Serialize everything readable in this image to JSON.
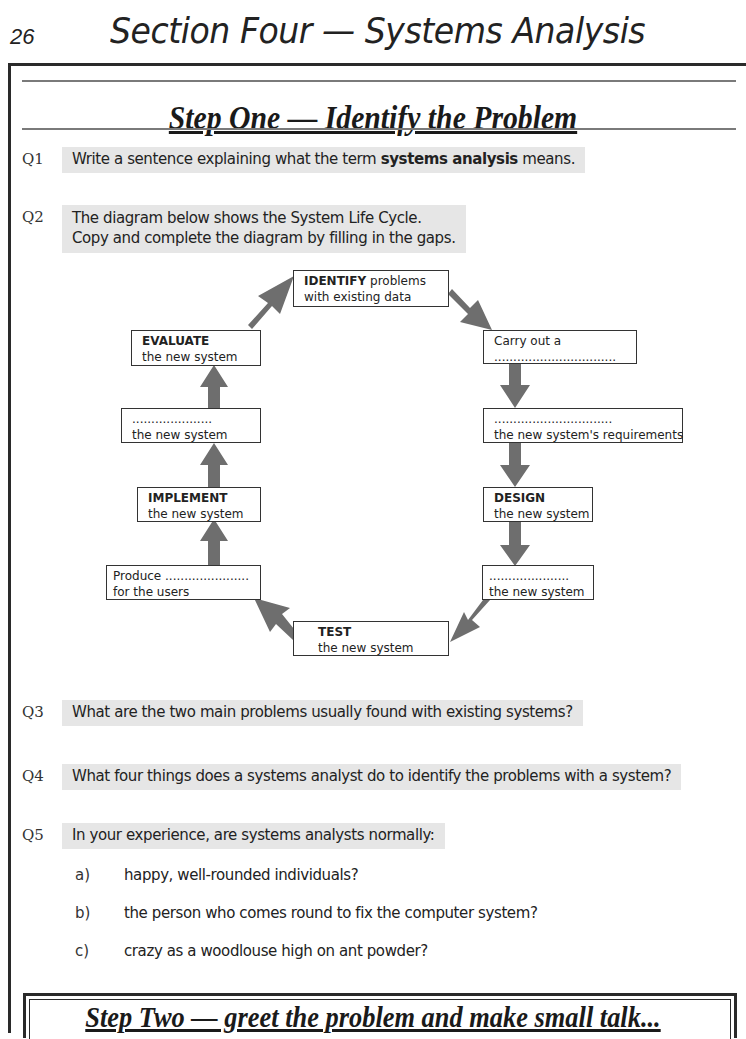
{
  "header": {
    "page_number": "26",
    "section_title": "Section Four — Systems Analysis"
  },
  "step_one": {
    "title": "Step One — Identify the Problem"
  },
  "questions": {
    "q1": {
      "number": "Q1",
      "text_before": "Write a sentence explaining what the term ",
      "text_bold": "systems analysis",
      "text_after": " means."
    },
    "q2": {
      "number": "Q2",
      "line1": "The diagram below shows the System Life Cycle.",
      "line2": "Copy and complete the diagram by filling in the gaps."
    },
    "q3": {
      "number": "Q3",
      "text": "What are the two main problems usually found with existing systems?"
    },
    "q4": {
      "number": "Q4",
      "text": "What four things does a systems analyst do to identify the problems with a system?"
    },
    "q5": {
      "number": "Q5",
      "text": "In your experience, are systems analysts normally:",
      "options": [
        {
          "label": "a)",
          "text": "happy, well-rounded individuals?"
        },
        {
          "label": "b)",
          "text": "the person who comes round to fix the computer system?"
        },
        {
          "label": "c)",
          "text": "crazy as a woodlouse high on ant powder?"
        }
      ]
    }
  },
  "diagram": {
    "title": "System Life Cycle",
    "arrow_color": "#6e6e6e",
    "boxes": {
      "identify": {
        "line1": "IDENTIFY",
        "line1_rest": " problems",
        "line2": "with existing data"
      },
      "carry_out": {
        "line1": "Carry out a",
        "line2": "................................"
      },
      "requirements": {
        "line1": "...............................",
        "line2": "the new system's requirements"
      },
      "design": {
        "line1": "DESIGN",
        "line2": "the new system"
      },
      "blank_right": {
        "line1": ".....................",
        "line2": "the new system"
      },
      "test": {
        "line1": "TEST",
        "line2": "the new system"
      },
      "produce": {
        "line1": "Produce ......................",
        "line2": "for the users"
      },
      "implement": {
        "line1": "IMPLEMENT",
        "line2": "the new system"
      },
      "blank_left": {
        "line1": ".....................",
        "line2": "the new system"
      },
      "evaluate": {
        "line1": "EVALUATE",
        "line2": "the new system"
      }
    }
  },
  "step_two": {
    "title": "Step Two — greet the problem and make small talk..."
  }
}
